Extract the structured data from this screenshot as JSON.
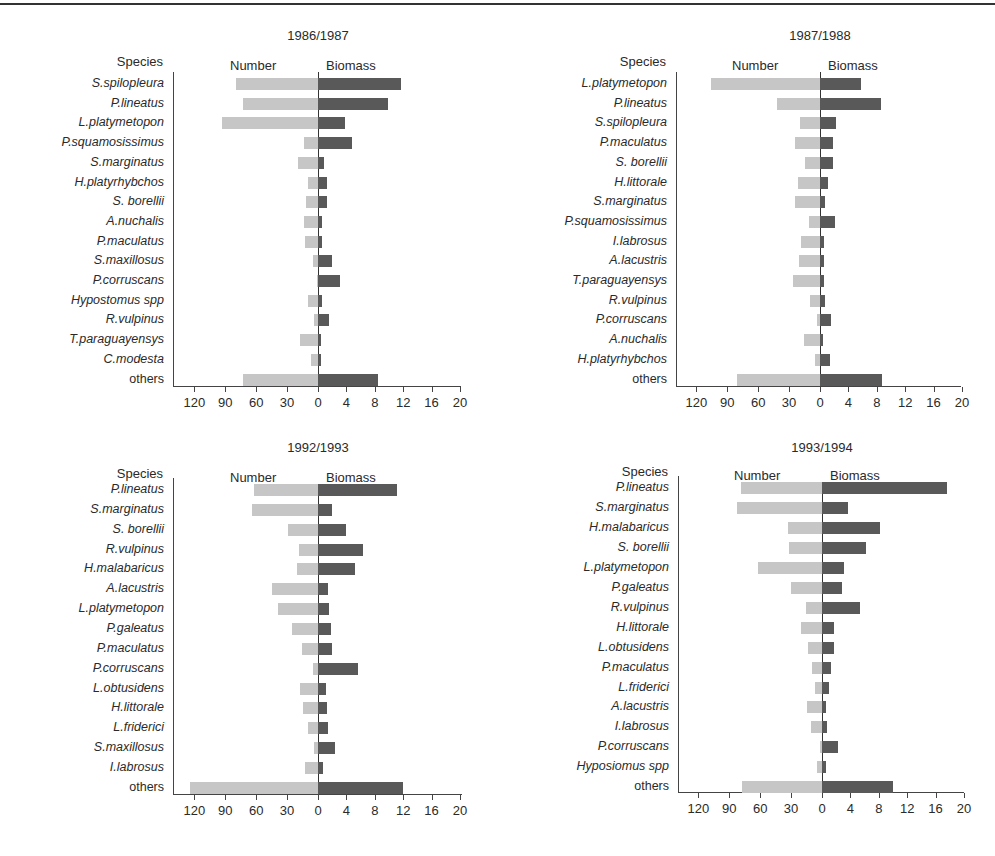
{
  "figure": {
    "legend_number": "Number",
    "legend_biomass": "Biomass",
    "species_header": "Species",
    "colors": {
      "number_bar": "#c6c6c6",
      "biomass_bar": "#595959",
      "axis": "#444444"
    }
  },
  "chart_data": [
    {
      "type": "bar",
      "orientation": "horizontal-diverging",
      "title": "1986/1987",
      "ylabel": "Species",
      "x_left_label": "Number",
      "x_right_label": "Biomass",
      "number_ticks": [
        120,
        90,
        60,
        30,
        0
      ],
      "biomass_ticks": [
        0,
        4,
        8,
        12,
        16,
        20
      ],
      "number_range": [
        0,
        140
      ],
      "biomass_range": [
        0,
        20
      ],
      "categories": [
        "S.spilopleura",
        "P.lineatus",
        "L.platymetopon",
        "P.squamosissimus",
        "S.marginatus",
        "H.platyrhybchos",
        "S. borellii",
        "A.nuchalis",
        "P.maculatus",
        "S.maxillosus",
        "P.corruscans",
        "Hypostomus spp",
        "R.vulpinus",
        "T.paraguayensys",
        "C.modesta",
        "others"
      ],
      "series": [
        {
          "name": "Number",
          "values": [
            80,
            73,
            93,
            14,
            19,
            10,
            12,
            14,
            13,
            5,
            1,
            10,
            4,
            17,
            7,
            73
          ]
        },
        {
          "name": "Biomass",
          "values": [
            11.7,
            9.9,
            3.8,
            4.8,
            0.9,
            1.3,
            1.3,
            0.6,
            0.6,
            2.0,
            3.1,
            0.6,
            1.5,
            0.4,
            0.4,
            8.5
          ]
        }
      ]
    },
    {
      "type": "bar",
      "orientation": "horizontal-diverging",
      "title": "1987/1988",
      "ylabel": "Species",
      "x_left_label": "Number",
      "x_right_label": "Biomass",
      "number_ticks": [
        120,
        90,
        60,
        30,
        0
      ],
      "biomass_ticks": [
        0,
        4,
        8,
        12,
        16,
        20
      ],
      "number_range": [
        0,
        140
      ],
      "biomass_range": [
        0,
        20
      ],
      "categories": [
        "L.platymetopon",
        "P.lineatus",
        "S.spilopleura",
        "P.maculatus",
        "S. borellii",
        "H.littorale",
        "S.marginatus",
        "P.squamosissimus",
        "I.labrosus",
        "A.lacustris",
        "T.paraguayensys",
        "R.vulpinus",
        "P.corruscans",
        "A.nuchalis",
        "H.platyrhybchos",
        "others"
      ],
      "series": [
        {
          "name": "Number",
          "values": [
            106,
            42,
            19,
            24,
            15,
            21,
            24,
            11,
            18,
            20,
            26,
            10,
            3,
            16,
            5,
            81
          ]
        },
        {
          "name": "Biomass",
          "values": [
            5.8,
            8.6,
            2.3,
            1.8,
            1.8,
            1.1,
            0.7,
            2.1,
            0.6,
            0.6,
            0.5,
            0.7,
            1.6,
            0.4,
            1.4,
            8.8
          ]
        }
      ]
    },
    {
      "type": "bar",
      "orientation": "horizontal-diverging",
      "title": "1992/1993",
      "ylabel": "Species",
      "x_left_label": "Number",
      "x_right_label": "Biomass",
      "number_ticks": [
        120,
        90,
        60,
        30,
        0
      ],
      "biomass_ticks": [
        0,
        4,
        8,
        12,
        16,
        20
      ],
      "number_range": [
        0,
        140
      ],
      "biomass_range": [
        0,
        20
      ],
      "categories": [
        "P.lineatus",
        "S.marginatus",
        "S. borellii",
        "R.vulpinus",
        "H.malabaricus",
        "A.lacustris",
        "L.platymetopon",
        "P.galeatus",
        "P.maculatus",
        "P.corruscans",
        "L.obtusidens",
        "H.littorale",
        "L.friderici",
        "S.maxillosus",
        "I.labrosus",
        "others"
      ],
      "series": [
        {
          "name": "Number",
          "values": [
            62,
            64,
            29,
            18,
            20,
            45,
            39,
            25,
            16,
            5,
            17,
            15,
            10,
            4,
            13,
            124
          ]
        },
        {
          "name": "Biomass",
          "values": [
            11.1,
            2.0,
            3.9,
            6.3,
            5.2,
            1.4,
            1.5,
            1.8,
            2.0,
            5.7,
            1.1,
            1.2,
            1.4,
            2.4,
            0.7,
            12.0
          ]
        }
      ]
    },
    {
      "type": "bar",
      "orientation": "horizontal-diverging",
      "title": "1993/1994",
      "ylabel": "Species",
      "x_left_label": "Number",
      "x_right_label": "Biomass",
      "number_ticks": [
        120,
        90,
        60,
        30,
        0
      ],
      "biomass_ticks": [
        0,
        4,
        8,
        12,
        16,
        20
      ],
      "number_range": [
        0,
        140
      ],
      "biomass_range": [
        0,
        20
      ],
      "categories": [
        "P.lineatus",
        "S.marginatus",
        "H.malabaricus",
        "S. borellii",
        "L.platymetopon",
        "P.galeatus",
        "R.vulpinus",
        "H.littorale",
        "L.obtusidens",
        "P.maculatus",
        "L.friderici",
        "A.lacustris",
        "I.labrosus",
        "P.corruscans",
        "Hyposiomus spp",
        "others"
      ],
      "series": [
        {
          "name": "Number",
          "values": [
            79,
            83,
            33,
            32,
            62,
            30,
            16,
            20,
            14,
            10,
            7,
            15,
            11,
            2,
            5,
            78
          ]
        },
        {
          "name": "Biomass",
          "values": [
            17.6,
            3.7,
            8.2,
            6.2,
            3.1,
            2.8,
            5.4,
            1.7,
            1.7,
            1.3,
            1.0,
            0.6,
            0.7,
            2.3,
            0.6,
            10.0
          ]
        }
      ]
    }
  ]
}
